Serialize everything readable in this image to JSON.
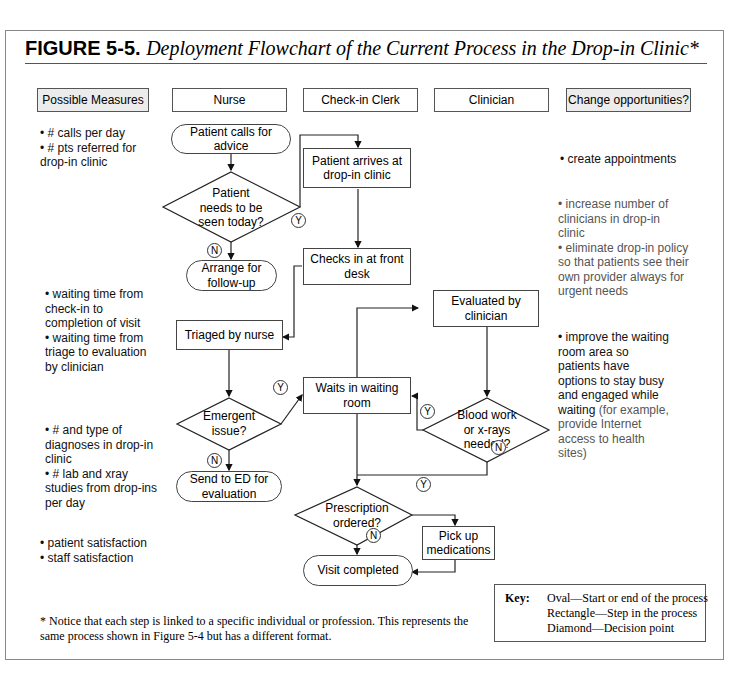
{
  "figure": {
    "label": "FIGURE 5-5.",
    "caption": "Deployment Flowchart of the Current Process in the Drop-in Clinic*"
  },
  "lanes": [
    {
      "label": "Possible Measures",
      "shaded": true
    },
    {
      "label": "Nurse",
      "shaded": false
    },
    {
      "label": "Check-in Clerk",
      "shaded": false
    },
    {
      "label": "Clinician",
      "shaded": false
    },
    {
      "label": "Change opportunities?",
      "shaded": true
    }
  ],
  "measures": [
    "• # calls per day\n• # pts referred for\ndrop-in clinic",
    "• waiting time from\ncheck-in to\ncompletion of visit\n• waiting time from\ntriage to evaluation\nby clinician",
    "• # and type of\ndiagnoses in drop-in\nclinic\n• # lab and xray\nstudies from drop-ins\nper day",
    "• patient satisfaction\n• staff satisfaction"
  ],
  "opportunities": [
    {
      "main": "• create appointments",
      "sub": ""
    },
    {
      "main": "• increase number of\nclinicians in drop-in\nclinic\n• eliminate drop-in policy\nso that patients see their\nown provider always for\nurgent needs",
      "sub": ""
    },
    {
      "main": "• improve the waiting\nroom area so\npatients have\noptions to stay busy\nand engaged while\nwaiting",
      "sub": " (for example,\nprovide Internet\naccess to health\nsites)"
    }
  ],
  "nodes": {
    "calls": "Patient calls for\nadvice",
    "needs_seen": "Patient\nneeds to be\nseen today?",
    "arrange": "Arrange for\nfollow-up",
    "arrives": "Patient arrives at\ndrop-in clinic",
    "checks_in": "Checks in at front\ndesk",
    "triaged": "Triaged by nurse",
    "emergent": "Emergent\nissue?",
    "send_ed": "Send to ED for\nevaluation",
    "waits": "Waits in waiting\nroom",
    "evaluated": "Evaluated by\nclinician",
    "blood": "Blood work\nor x-rays\nneeded?",
    "prescription": "Prescription\nordered?",
    "pickup": "Pick up\nmedications",
    "completed": "Visit completed"
  },
  "decision_labels": {
    "yes": "Y",
    "no": "N"
  },
  "footnote": "* Notice that each step is linked to a specific individual or profession. This represents the same process shown in Figure 5-4 but has a different format.",
  "key": {
    "label": "Key:",
    "items": "Oval—Start or end of the process\nRectangle—Step in the process\nDiamond—Decision point"
  }
}
